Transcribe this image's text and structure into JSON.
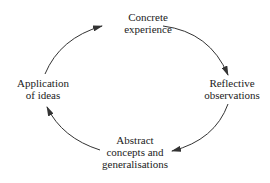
{
  "diagram": {
    "type": "cycle",
    "direction": "clockwise",
    "nodes": [
      {
        "id": "concrete",
        "lines": [
          "Concrete",
          "experience"
        ]
      },
      {
        "id": "reflective",
        "lines": [
          "Reflective",
          "observations"
        ]
      },
      {
        "id": "abstract",
        "lines": [
          "Abstract",
          "concepts and",
          "generalisations"
        ]
      },
      {
        "id": "application",
        "lines": [
          "Application",
          "of ideas"
        ]
      }
    ],
    "edges": [
      {
        "from": "concrete",
        "to": "reflective"
      },
      {
        "from": "reflective",
        "to": "abstract"
      },
      {
        "from": "abstract",
        "to": "application"
      },
      {
        "from": "application",
        "to": "concrete"
      }
    ],
    "colors": {
      "line": "#333333",
      "text": "#222222",
      "background": "#ffffff"
    }
  }
}
